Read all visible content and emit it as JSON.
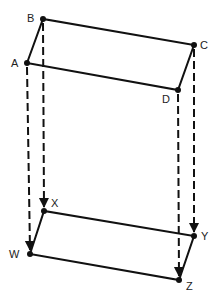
{
  "diagram": {
    "colors": {
      "stroke": "#111111",
      "label": "#222222",
      "background": "#ffffff"
    },
    "top_shape": {
      "points": {
        "A": {
          "label": "A",
          "x": 27,
          "y": 63,
          "lx": 11,
          "ly": 67
        },
        "B": {
          "label": "B",
          "x": 43,
          "y": 19,
          "lx": 27,
          "ly": 22
        },
        "C": {
          "label": "C",
          "x": 194,
          "y": 45,
          "lx": 200,
          "ly": 49
        },
        "D": {
          "label": "D",
          "x": 178,
          "y": 90,
          "lx": 162,
          "ly": 103
        }
      }
    },
    "bottom_shape": {
      "points": {
        "X": {
          "label": "X",
          "x": 44,
          "y": 211,
          "lx": 51,
          "ly": 207
        },
        "W": {
          "label": "W",
          "x": 30,
          "y": 254,
          "lx": 9,
          "ly": 258
        },
        "Y": {
          "label": "Y",
          "x": 194,
          "y": 236,
          "lx": 201,
          "ly": 240
        },
        "Z": {
          "label": "Z",
          "x": 179,
          "y": 280,
          "lx": 186,
          "ly": 290
        }
      }
    },
    "projections": [
      {
        "from": "A",
        "to": "W"
      },
      {
        "from": "B",
        "to": "X"
      },
      {
        "from": "C",
        "to": "Y"
      },
      {
        "from": "D",
        "to": "Z"
      }
    ]
  }
}
